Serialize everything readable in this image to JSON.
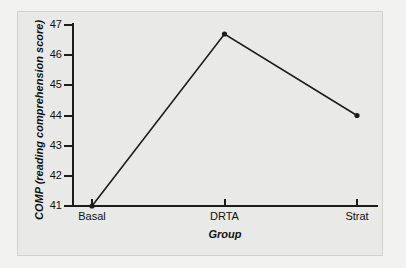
{
  "chart_data": {
    "type": "line",
    "title": "",
    "xlabel": "Group",
    "ylabel": "COMP (reading comprehension score)",
    "categories": [
      "Basal",
      "DRTA",
      "Strat"
    ],
    "values": [
      41.0,
      46.7,
      44.0
    ],
    "series": [
      {
        "name": "COMP mean",
        "values": [
          41.0,
          46.7,
          44.0
        ]
      }
    ],
    "yticks": [
      41,
      42,
      43,
      44,
      45,
      46,
      47
    ],
    "ytick_labels": [
      "41",
      "42",
      "43",
      "44",
      "45",
      "46",
      "47"
    ],
    "ylim": [
      41,
      47
    ],
    "xlim": [
      0,
      2
    ],
    "grid": false,
    "legend": false,
    "markers": "filled-circle",
    "line_color": "#1d1d1d",
    "plot_background": "#e9e9e7",
    "figure_background": "#f2f2f0"
  },
  "axes": {
    "y_title": "COMP (reading comprehension score)",
    "x_title": "Group"
  }
}
